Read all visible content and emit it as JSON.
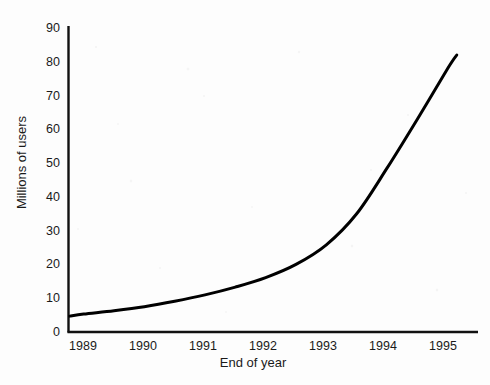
{
  "chart_data": {
    "type": "line",
    "title": "",
    "subtitle": "",
    "xlabel": "End of year",
    "ylabel": "Millions of users",
    "xlim": [
      1988.75,
      1995.5
    ],
    "ylim": [
      0,
      90
    ],
    "grid": false,
    "legend": null,
    "legend_position": "none",
    "line_color": "#000000",
    "line_width": 3,
    "x_tick_labels": [
      "1989",
      "1990",
      "1991",
      "1992",
      "1993",
      "1994",
      "1995"
    ],
    "y_tick_labels": [
      "0",
      "10",
      "20",
      "30",
      "40",
      "50",
      "60",
      "70",
      "80",
      "90"
    ],
    "x_ticks": [
      1989,
      1990,
      1991,
      1992,
      1993,
      1994,
      1995
    ],
    "y_ticks": [
      0,
      10,
      20,
      30,
      40,
      50,
      60,
      70,
      80,
      90
    ],
    "series": [
      {
        "name": "Millions of users",
        "x": [
          1988.77,
          1989.0,
          1989.5,
          1990.0,
          1990.5,
          1991.0,
          1991.5,
          1992.0,
          1992.5,
          1993.0,
          1993.5,
          1994.0,
          1994.5,
          1995.0,
          1995.15
        ],
        "values": [
          4.7,
          5.3,
          6.3,
          7.5,
          9.1,
          11.0,
          13.3,
          16.1,
          20.0,
          25.8,
          35.0,
          48.5,
          63.0,
          78.0,
          82.0
        ]
      }
    ],
    "annotations": []
  },
  "axes": {
    "x_axis_name": "End of year",
    "y_axis_name": "Millions of users"
  }
}
